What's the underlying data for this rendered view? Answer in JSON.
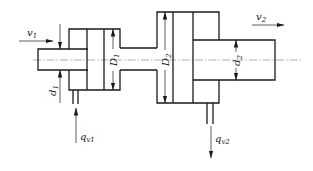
{
  "diagram": {
    "colors": {
      "line": "#1a1a1a",
      "centerline": "#7a7a7a",
      "background": "#ffffff"
    },
    "labels": {
      "v1": {
        "main": "v",
        "sub": "1"
      },
      "v2": {
        "main": "v",
        "sub": "2"
      },
      "D1": {
        "main": "D",
        "sub": "1"
      },
      "D2": {
        "main": "D",
        "sub": "2"
      },
      "d1": {
        "main": "d",
        "sub": "1"
      },
      "d2": {
        "main": "d",
        "sub": "2"
      },
      "qv1": {
        "main": "q",
        "sub": "v1"
      },
      "qv2": {
        "main": "q",
        "sub": "v2"
      }
    },
    "components": [
      {
        "id": "left-rod",
        "description": "Input piston rod, diameter d1"
      },
      {
        "id": "left-cylinder",
        "description": "Cylinder 1 with piston diameter D1"
      },
      {
        "id": "connecting-neck",
        "description": "Connecting passage between cylinders"
      },
      {
        "id": "right-cylinder",
        "description": "Cylinder 2 with piston diameter D2"
      },
      {
        "id": "right-rod",
        "description": "Output piston rod, diameter d2"
      },
      {
        "id": "inlet-port",
        "description": "Inlet flow qv1"
      },
      {
        "id": "outlet-port",
        "description": "Outlet flow qv2"
      }
    ]
  }
}
